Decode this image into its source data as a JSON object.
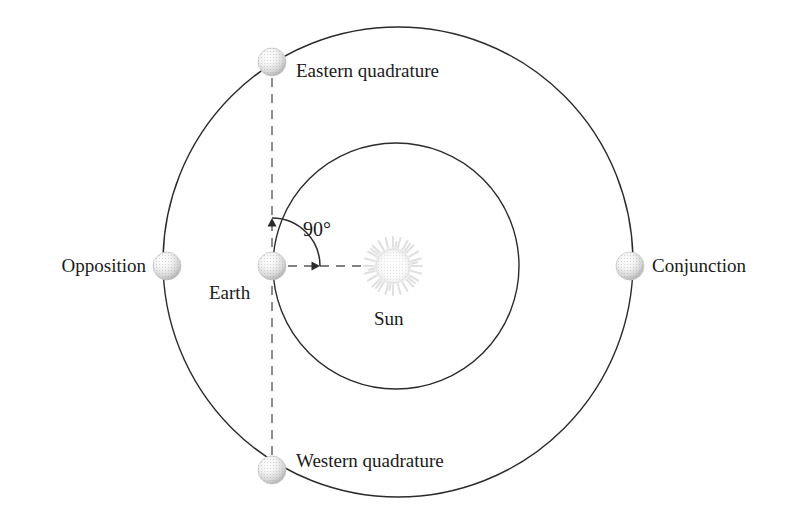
{
  "diagram": {
    "type": "orbital-configuration-diagram",
    "background_color": "#ffffff",
    "line_color": "#2b2b2b",
    "dash_color": "#7a7a7a",
    "text_color": "#1a1a1a",
    "bodies": {
      "sun": {
        "label": "Sun",
        "cx": 393,
        "cy": 266,
        "disc_radius": 17,
        "corona_radius": 28,
        "label_x": 394,
        "label_y": 320
      },
      "earth": {
        "label": "Earth",
        "cx": 272,
        "cy": 266,
        "radius": 14,
        "label_x": 238,
        "label_y": 294
      }
    },
    "orbits": {
      "earth_orbit": {
        "name": "Earth orbit",
        "cx": 396,
        "cy": 266,
        "radius": 123
      },
      "planet_orbit": {
        "name": "Superior planet orbit",
        "cx": 398,
        "cy": 262,
        "radius": 235
      }
    },
    "angle": {
      "label": "90°",
      "value": 90,
      "unit": "degrees",
      "vertex_x": 272,
      "vertex_y": 266,
      "arc_radius": 48,
      "label_x": 322,
      "label_y": 231
    },
    "positions": [
      {
        "id": "eastern-quadrature",
        "label": "Eastern quadrature",
        "cx": 272,
        "cy": 62,
        "radius": 14,
        "label_x": 296,
        "label_y": 71,
        "label_align": "left"
      },
      {
        "id": "opposition",
        "label": "Opposition",
        "cx": 167,
        "cy": 266,
        "radius": 14,
        "label_x": 146,
        "label_y": 274,
        "label_align": "right"
      },
      {
        "id": "conjunction",
        "label": "Conjunction",
        "cx": 630,
        "cy": 266,
        "radius": 14,
        "label_x": 652,
        "label_y": 274,
        "label_align": "left"
      },
      {
        "id": "western-quadrature",
        "label": "Western quadrature",
        "cx": 272,
        "cy": 470,
        "radius": 14,
        "label_x": 296,
        "label_y": 467,
        "label_align": "left"
      }
    ],
    "sight_lines": [
      {
        "id": "earth-sun-line",
        "style": "dashed",
        "from": "Earth",
        "to": "Sun"
      },
      {
        "id": "earth-quadrature-line",
        "style": "dashed",
        "from": "Eastern quadrature",
        "to": "Western quadrature"
      }
    ]
  }
}
